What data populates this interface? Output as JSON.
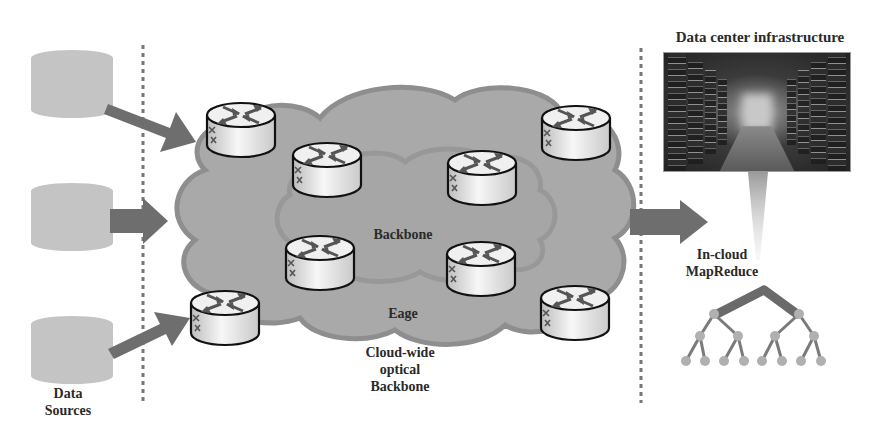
{
  "title": "Data center infrastructure",
  "labels": {
    "data_sources": [
      "Data",
      "Sources"
    ],
    "backbone": "Backbone",
    "edge": "Eage",
    "cloud_wide": [
      "Cloud-wide",
      "optical",
      "Backbone"
    ],
    "mapreduce": [
      "In-cloud",
      "MapReduce"
    ],
    "datacenter": "Data center infrastructure"
  },
  "colors": {
    "db_fill": "#c4c4c4",
    "arrow_fill": "#6e6e6e",
    "cloud_outer": "#a9a9a9",
    "cloud_outer_stroke": "#8e8e8e",
    "cloud_inner_stroke": "#969696",
    "router_stroke": "#111111",
    "router_top": "#f2f2f2",
    "tree_node": "#b0b0b0",
    "tree_edge": "#7a7a7a",
    "divider": "#777777"
  },
  "data_sources": [
    {
      "id": "source-1"
    },
    {
      "id": "source-2"
    },
    {
      "id": "source-3"
    }
  ],
  "routers": [
    {
      "id": "router-edge-top-left"
    },
    {
      "id": "router-backbone-top-left"
    },
    {
      "id": "router-backbone-top-right"
    },
    {
      "id": "router-edge-top-right"
    },
    {
      "id": "router-backbone-bottom-left"
    },
    {
      "id": "router-backbone-bottom-right"
    },
    {
      "id": "router-edge-bottom-left"
    },
    {
      "id": "router-edge-bottom-right"
    }
  ],
  "mapreduce_tree": {
    "levels": 4,
    "leaves": 8
  }
}
